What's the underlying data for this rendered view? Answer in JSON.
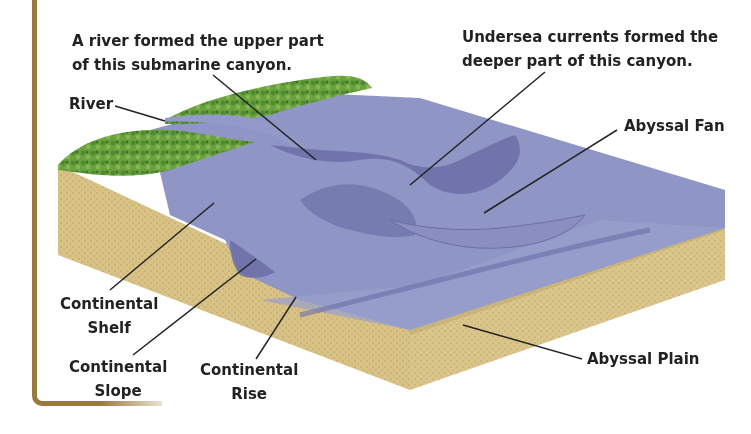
{
  "diagram": {
    "type": "ocean-floor-cross-section",
    "colors": {
      "frame": "#9a7a3c",
      "water": "#8f96c6",
      "water_dark": "#6b6ea6",
      "sediment": "#d9c48a",
      "vegetation": "#5f9a3a",
      "text": "#222222",
      "leader_line": "#222222"
    },
    "annotations": {
      "river_canyon": {
        "line1": "A river formed the upper part",
        "line2": "of this submarine canyon."
      },
      "undersea_currents": {
        "line1": "Undersea currents formed the",
        "line2": "deeper part of this canyon."
      }
    },
    "labels": {
      "river": "River",
      "abyssal_fan": "Abyssal Fan",
      "continental_shelf": {
        "line1": "Continental",
        "line2": "Shelf"
      },
      "continental_slope": {
        "line1": "Continental",
        "line2": "Slope"
      },
      "continental_rise": {
        "line1": "Continental",
        "line2": "Rise"
      },
      "abyssal_plain": "Abyssal Plain"
    }
  }
}
